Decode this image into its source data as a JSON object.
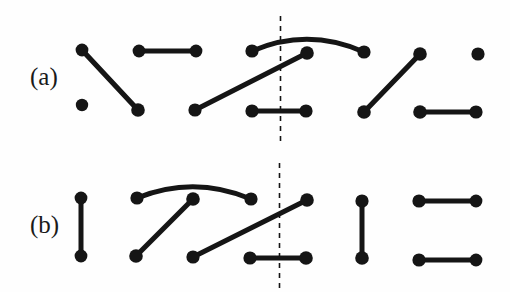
{
  "figure": {
    "title": "",
    "background_color": "#fefefe",
    "ink_color": "#151515",
    "width": 510,
    "height": 292,
    "rows": [
      {
        "id": "row-a",
        "label": "(a)",
        "label_x": 30,
        "label_y": 64,
        "divider": {
          "x": 280.5,
          "y1": 16,
          "y2": 143,
          "style": "dashed",
          "dash": "5,5",
          "width": 1.6
        },
        "nodes": [
          {
            "name": "a-t1",
            "x": 82,
            "y": 50,
            "r": 6.4
          },
          {
            "name": "a-t2",
            "x": 139,
            "y": 51,
            "r": 6.4
          },
          {
            "name": "a-t3",
            "x": 196,
            "y": 51,
            "r": 6.4
          },
          {
            "name": "a-t4",
            "x": 252,
            "y": 51,
            "r": 6.6
          },
          {
            "name": "a-t5",
            "x": 307,
            "y": 53,
            "r": 6.8
          },
          {
            "name": "a-t6",
            "x": 364,
            "y": 52,
            "r": 6.6
          },
          {
            "name": "a-t7",
            "x": 420,
            "y": 54,
            "r": 6.8
          },
          {
            "name": "a-t8",
            "x": 478,
            "y": 54,
            "r": 6.6
          },
          {
            "name": "a-b1",
            "x": 82,
            "y": 105,
            "r": 6.2
          },
          {
            "name": "a-b2",
            "x": 138,
            "y": 110,
            "r": 6.8
          },
          {
            "name": "a-b3",
            "x": 195,
            "y": 110,
            "r": 6.6
          },
          {
            "name": "a-b4",
            "x": 252,
            "y": 111,
            "r": 6.6
          },
          {
            "name": "a-b5",
            "x": 306,
            "y": 111,
            "r": 6.6
          },
          {
            "name": "a-b6",
            "x": 364,
            "y": 112,
            "r": 6.8
          },
          {
            "name": "a-b7",
            "x": 420,
            "y": 112,
            "r": 6.8
          },
          {
            "name": "a-b8",
            "x": 476,
            "y": 112,
            "r": 6.6
          }
        ],
        "edges": [
          {
            "name": "a-edge-1",
            "type": "line",
            "x1": 82,
            "y1": 50,
            "x2": 138,
            "y2": 110,
            "width": 5.2
          },
          {
            "name": "a-edge-2",
            "type": "line",
            "x1": 139,
            "y1": 51,
            "x2": 196,
            "y2": 51,
            "width": 4.8
          },
          {
            "name": "a-edge-3",
            "type": "line",
            "x1": 195,
            "y1": 110,
            "x2": 307,
            "y2": 53,
            "width": 5.2
          },
          {
            "name": "a-edge-4",
            "type": "arc",
            "x1": 252,
            "y1": 51,
            "x2": 364,
            "y2": 52,
            "cx": 308,
            "cy": 27,
            "width": 5.0
          },
          {
            "name": "a-edge-5",
            "type": "line",
            "x1": 252,
            "y1": 111,
            "x2": 306,
            "y2": 111,
            "width": 4.8
          },
          {
            "name": "a-edge-6",
            "type": "line",
            "x1": 364,
            "y1": 112,
            "x2": 420,
            "y2": 54,
            "width": 5.2
          },
          {
            "name": "a-edge-7",
            "type": "line",
            "x1": 420,
            "y1": 112,
            "x2": 476,
            "y2": 112,
            "width": 4.8
          }
        ],
        "isolated_nodes": [
          "a-b1",
          "a-t8"
        ]
      },
      {
        "id": "row-b",
        "label": "(b)",
        "label_x": 30,
        "label_y": 212,
        "divider": {
          "x": 279.5,
          "y1": 163,
          "y2": 290,
          "style": "dashed",
          "dash": "5,5",
          "width": 1.6
        },
        "nodes": [
          {
            "name": "b-t1",
            "x": 81,
            "y": 198,
            "r": 6.4
          },
          {
            "name": "b-t2",
            "x": 137,
            "y": 198,
            "r": 6.6
          },
          {
            "name": "b-t3",
            "x": 193,
            "y": 199,
            "r": 6.8
          },
          {
            "name": "b-t4",
            "x": 251,
            "y": 199,
            "r": 6.6
          },
          {
            "name": "b-t5",
            "x": 307,
            "y": 200,
            "r": 6.8
          },
          {
            "name": "b-t6",
            "x": 362,
            "y": 201,
            "r": 6.6
          },
          {
            "name": "b-t7",
            "x": 419,
            "y": 201,
            "r": 6.6
          },
          {
            "name": "b-t8",
            "x": 476,
            "y": 201,
            "r": 6.4
          },
          {
            "name": "b-b1",
            "x": 81,
            "y": 256,
            "r": 6.4
          },
          {
            "name": "b-b2",
            "x": 136,
            "y": 256,
            "r": 6.8
          },
          {
            "name": "b-b3",
            "x": 193,
            "y": 257,
            "r": 6.6
          },
          {
            "name": "b-b4",
            "x": 250,
            "y": 258,
            "r": 6.6
          },
          {
            "name": "b-b5",
            "x": 306,
            "y": 258,
            "r": 6.8
          },
          {
            "name": "b-b6",
            "x": 362,
            "y": 258,
            "r": 6.8
          },
          {
            "name": "b-b7",
            "x": 419,
            "y": 260,
            "r": 6.6
          },
          {
            "name": "b-b8",
            "x": 476,
            "y": 260,
            "r": 6.4
          }
        ],
        "edges": [
          {
            "name": "b-edge-1",
            "type": "line",
            "x1": 81,
            "y1": 198,
            "x2": 81,
            "y2": 256,
            "width": 5.0
          },
          {
            "name": "b-edge-2",
            "type": "arc",
            "x1": 137,
            "y1": 198,
            "x2": 251,
            "y2": 199,
            "cx": 194,
            "cy": 175,
            "width": 5.0
          },
          {
            "name": "b-edge-3",
            "type": "line",
            "x1": 136,
            "y1": 256,
            "x2": 193,
            "y2": 199,
            "width": 5.2
          },
          {
            "name": "b-edge-4",
            "type": "line",
            "x1": 193,
            "y1": 257,
            "x2": 307,
            "y2": 200,
            "width": 5.2
          },
          {
            "name": "b-edge-5",
            "type": "line",
            "x1": 250,
            "y1": 258,
            "x2": 306,
            "y2": 258,
            "width": 4.8
          },
          {
            "name": "b-edge-6",
            "type": "line",
            "x1": 362,
            "y1": 201,
            "x2": 362,
            "y2": 258,
            "width": 5.0
          },
          {
            "name": "b-edge-7",
            "type": "line",
            "x1": 419,
            "y1": 201,
            "x2": 476,
            "y2": 201,
            "width": 4.8
          },
          {
            "name": "b-edge-8",
            "type": "line",
            "x1": 419,
            "y1": 260,
            "x2": 476,
            "y2": 260,
            "width": 4.8
          }
        ],
        "isolated_nodes": []
      }
    ]
  }
}
